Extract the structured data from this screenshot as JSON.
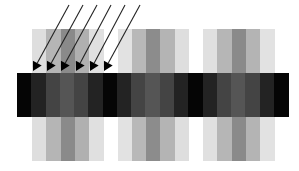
{
  "figure": {
    "width": 299,
    "height": 171,
    "background": "#ffffff"
  },
  "columns": {
    "top": 29,
    "upper_bottom": 73,
    "lower_top": 117,
    "bottom": 161,
    "stripe_width": 14.3,
    "groups": [
      {
        "x": 32,
        "colors": [
          "#dedede",
          "#b5b5b5",
          "#8a8a8a",
          "#b0b0b0",
          "#e0e0e0"
        ]
      },
      {
        "x": 117.5,
        "colors": [
          "#e2e2e2",
          "#b8b8b8",
          "#8c8c8c",
          "#b4b4b4",
          "#dedede"
        ]
      },
      {
        "x": 203,
        "colors": [
          "#e0e0e0",
          "#b6b6b6",
          "#8a8a8a",
          "#b4b4b4",
          "#e2e2e2"
        ]
      }
    ]
  },
  "band": {
    "x": 17,
    "y": 73,
    "height": 44,
    "segment_width": 14.27,
    "colors": [
      "#050505",
      "#232323",
      "#444444",
      "#555555",
      "#444444",
      "#232323",
      "#050505",
      "#232323",
      "#444444",
      "#555555",
      "#444444",
      "#232323",
      "#050505",
      "#232323",
      "#444444",
      "#555555",
      "#444444",
      "#232323",
      "#050505"
    ]
  },
  "arrows": {
    "color": "#222222",
    "items": [
      {
        "x1": 69,
        "y1": 5,
        "x2": 33,
        "y2": 71
      },
      {
        "x1": 83,
        "y1": 5,
        "x2": 47,
        "y2": 71
      },
      {
        "x1": 97,
        "y1": 5,
        "x2": 61,
        "y2": 71
      },
      {
        "x1": 111,
        "y1": 5,
        "x2": 76,
        "y2": 71
      },
      {
        "x1": 125,
        "y1": 5,
        "x2": 90,
        "y2": 71
      },
      {
        "x1": 140,
        "y1": 5,
        "x2": 104,
        "y2": 71
      }
    ]
  }
}
